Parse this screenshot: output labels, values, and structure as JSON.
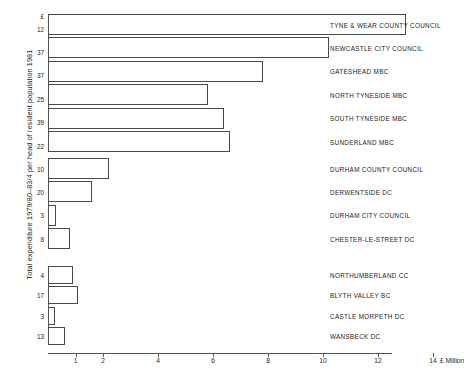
{
  "chart_data": {
    "type": "bar",
    "orientation": "horizontal",
    "title": "",
    "xlabel": "£ Million",
    "ylabel": "Total expenditure 1979/80–83/4 per head of resident population 1981",
    "xlim": [
      0,
      14.8
    ],
    "xticks": [
      1,
      2,
      4,
      6,
      8,
      10,
      12,
      14
    ],
    "xticklabels": [
      "1",
      "2",
      "4",
      "6",
      "8",
      "10",
      "12",
      "14"
    ],
    "xunit_label": "£ Million",
    "grid": false,
    "legend": "none",
    "groups": [
      {
        "name": "Tyne & Wear",
        "categories": [
          "TYNE & WEAR COUNTY COUNCIL",
          "NEWCASTLE CITY COUNCIL",
          "GATESHEAD MBC",
          "NORTH TYNESIDE MBC",
          "SOUTH TYNESIDE MBC",
          "SUNDERLAND MBC"
        ],
        "values": [
          13.0,
          10.2,
          7.8,
          5.8,
          6.4,
          6.6
        ],
        "tick_labels": [
          "£",
          "12",
          "37",
          "37",
          "25",
          "39",
          "22"
        ]
      },
      {
        "name": "Durham",
        "categories": [
          "DURHAM COUNTY COUNCIL",
          "DERWENTSIDE DC",
          "DURHAM CITY COUNCIL",
          "CHESTER-LE-STREET DC"
        ],
        "values": [
          2.2,
          1.6,
          0.3,
          0.8
        ],
        "tick_labels": [
          "10",
          "20",
          "3",
          "8"
        ]
      },
      {
        "name": "Northumberland",
        "categories": [
          "NORTHUMBERLAND CC",
          "BLYTH VALLEY BC",
          "CASTLE MORPETH DC",
          "WANSBECK DC"
        ],
        "values": [
          0.9,
          1.1,
          0.25,
          0.6
        ],
        "tick_labels": [
          "4",
          "17",
          "3",
          "13"
        ]
      }
    ]
  },
  "axis": {
    "y_title": "Total expenditure 1979/80–83/4 per head of resident population 1981",
    "x_unit": "£ Million"
  },
  "caption": {
    "text": ""
  }
}
